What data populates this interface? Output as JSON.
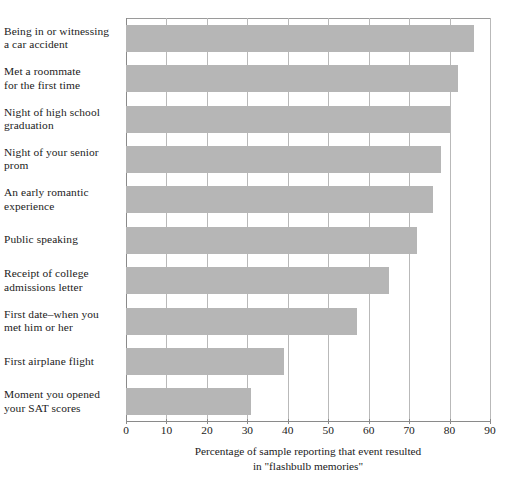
{
  "chart_data": {
    "type": "bar",
    "orientation": "horizontal",
    "title": "",
    "xlabel": "Percentage of sample reporting that event resulted in \"flashbulb memories\"",
    "ylabel": "",
    "xlim": [
      0,
      90
    ],
    "xticks": [
      0,
      10,
      20,
      30,
      40,
      50,
      60,
      70,
      80,
      90
    ],
    "xtick_labels": [
      "0",
      "10",
      "20",
      "30",
      "40",
      "50",
      "60",
      "70",
      "80",
      "90"
    ],
    "grid": true,
    "grid_axis": "x",
    "legend": false,
    "bar_color": "#b6b6b6",
    "axis_color": "#8a8a8a",
    "gridline_color": "#b9b9b9",
    "categories": [
      "Being in or witnessing a car accident",
      "Met a roommate for the first time",
      "Night of high school graduation",
      "Night of your senior prom",
      "An early romantic experience",
      "Public speaking",
      "Receipt of college admissions letter",
      "First date–when you met him or her",
      "First airplane flight",
      "Moment you opened your SAT scores"
    ],
    "category_lines": [
      [
        "Being in or witnessing",
        "a car accident"
      ],
      [
        "Met a roommate",
        "for the first time"
      ],
      [
        "Night of high school",
        "graduation"
      ],
      [
        "Night of your senior",
        "prom"
      ],
      [
        "An early romantic",
        "experience"
      ],
      [
        "Public speaking"
      ],
      [
        "Receipt of college",
        "admissions letter"
      ],
      [
        "First date–when you",
        "met him or her"
      ],
      [
        "First airplane flight"
      ],
      [
        "Moment you opened",
        "your SAT scores"
      ]
    ],
    "values": [
      86,
      82,
      80,
      78,
      76,
      72,
      65,
      57,
      39,
      31
    ]
  },
  "caption": {
    "line1": "Percentage of sample reporting that event resulted",
    "line2": "in \"flashbulb memories\""
  }
}
